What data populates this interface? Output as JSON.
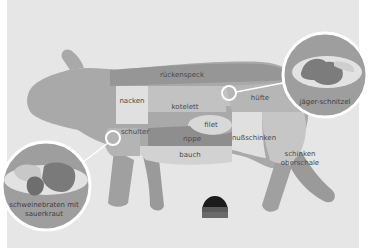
{
  "diagram": {
    "title": "",
    "colors": {
      "background": "#e6e6e6",
      "pig_body": "#a9a9a9",
      "ruckenspeck": "#9a9a9a",
      "light_cut": "#dcdcdc",
      "mid_cut": "#bdbdbd",
      "dark_cut": "#8c8c8c",
      "plate_circle": "#9e9e9e",
      "ring": "#ffffff"
    },
    "cuts": [
      {
        "id": "ruckenspeck",
        "label": "rückenspeck"
      },
      {
        "id": "nacken",
        "label": "nacken"
      },
      {
        "id": "kotelett",
        "label": "kotelett"
      },
      {
        "id": "hufte",
        "label": "hüfte"
      },
      {
        "id": "filet",
        "label": "filet"
      },
      {
        "id": "schulter",
        "label": "schulter"
      },
      {
        "id": "rippe",
        "label": "rippe"
      },
      {
        "id": "nusschinken",
        "label": "nußschinken"
      },
      {
        "id": "bauch",
        "label": "bauch"
      },
      {
        "id": "schinken_oberschale_1",
        "label": "schinken"
      },
      {
        "id": "schinken_oberschale_2",
        "label": "oberschale"
      }
    ],
    "dishes": [
      {
        "id": "jager_schnitzel",
        "label": "jäger-schnitzel",
        "linked_cut": "hüfte"
      },
      {
        "id": "schweinebraten",
        "label_line1": "schweinebraten mit",
        "label_line2": "sauerkraut",
        "linked_cut": "schulter"
      }
    ],
    "flag_icon": "german-flag-semicircle-icon"
  }
}
